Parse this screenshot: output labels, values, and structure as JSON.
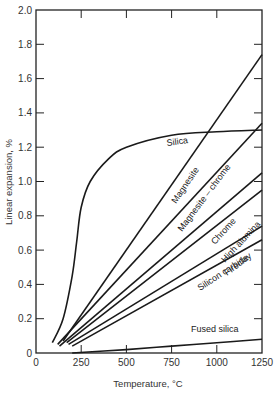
{
  "chart_data": {
    "type": "line",
    "title": "",
    "xlabel": "Temperature, °C",
    "ylabel": "Linear expansion, %",
    "xlim": [
      0,
      1250
    ],
    "ylim": [
      0,
      2.0
    ],
    "grid": false,
    "legend": "inline curve labels",
    "x_ticks": [
      0,
      250,
      500,
      750,
      1000,
      1250
    ],
    "y_ticks": [
      0,
      0.2,
      0.4,
      0.6,
      0.8,
      1.0,
      1.2,
      1.4,
      1.6,
      1.8,
      2.0
    ],
    "x_tick_labels": [
      "0",
      "250",
      "500",
      "750",
      "1000",
      "1250"
    ],
    "y_tick_labels": [
      "0",
      "0.2",
      "0.4",
      "0.6",
      "0.8",
      "1.0",
      "1.2",
      "1.4",
      "1.6",
      "1.8",
      "2.0"
    ],
    "series": [
      {
        "name": "Silica",
        "x": [
          90,
          150,
          200,
          225,
          250,
          300,
          400,
          500,
          750,
          1000,
          1250
        ],
        "values": [
          0.06,
          0.2,
          0.45,
          0.65,
          0.85,
          1.0,
          1.13,
          1.2,
          1.27,
          1.29,
          1.3
        ]
      },
      {
        "name": "Magnesite",
        "x": [
          150,
          1250
        ],
        "values": [
          0.07,
          1.74
        ]
      },
      {
        "name": "Magnesite – chrome",
        "x": [
          120,
          1250
        ],
        "values": [
          0.05,
          1.34
        ]
      },
      {
        "name": "Chrome",
        "x": [
          130,
          1250
        ],
        "values": [
          0.04,
          1.05
        ]
      },
      {
        "name": "High alumina",
        "x": [
          170,
          1250
        ],
        "values": [
          0.06,
          0.95
        ]
      },
      {
        "name": "Fireclay",
        "x": [
          180,
          1250
        ],
        "values": [
          0.05,
          0.74
        ]
      },
      {
        "name": "Silicon carbide",
        "x": [
          200,
          1250
        ],
        "values": [
          0.04,
          0.66
        ]
      },
      {
        "name": "Fused silica",
        "x": [
          200,
          500,
          750,
          1000,
          1250
        ],
        "values": [
          0.0,
          0.02,
          0.04,
          0.06,
          0.08
        ]
      }
    ],
    "annotations": [
      {
        "text": "Silica",
        "x": 500,
        "y": 1.27
      },
      {
        "text": "Magnesite",
        "x": 830,
        "y": 1.08
      },
      {
        "text": "Magnesite – chrome",
        "x": 920,
        "y": 1.02
      },
      {
        "text": "Chrome",
        "x": 1010,
        "y": 0.82
      },
      {
        "text": "High alumina",
        "x": 1070,
        "y": 0.8
      },
      {
        "text": "Fireclay",
        "x": 1090,
        "y": 0.69
      },
      {
        "text": "Silicon carbide",
        "x": 1020,
        "y": 0.56
      },
      {
        "text": "Fused silica",
        "x": 1000,
        "y": 0.13
      }
    ]
  },
  "labels": {
    "xlabel": "Temperature, °C",
    "ylabel": "Linear expansion, %",
    "curves": {
      "silica": "Silica",
      "magnesite": "Magnesite",
      "magnesite_chrome": "Magnesite – chrome",
      "chrome": "Chrome",
      "high_alumina": "High alumina",
      "fireclay": "Fireclay",
      "silicon_carbide": "Silicon carbide",
      "fused_silica": "Fused silica"
    }
  }
}
